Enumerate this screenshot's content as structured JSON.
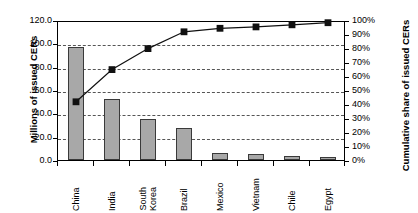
{
  "chart_data": {
    "type": "bar",
    "title": "",
    "subtitle": "",
    "xlabel": "",
    "ylabel": "Millions of issued CERs",
    "y2label": "Cumulative share of issued CERs",
    "categories": [
      "China",
      "India",
      "South\nKorea",
      "Brazil",
      "Mexico",
      "Vietnam",
      "Chile",
      "Egypt"
    ],
    "category_labels_flat": [
      "China",
      "India",
      "South Korea",
      "Brazil",
      "Mexico",
      "Vietnam",
      "Chile",
      "Egypt"
    ],
    "series": [
      {
        "name": "Millions of issued CERs",
        "type": "bar",
        "axis": "left",
        "values": [
          97.0,
          52.5,
          35.0,
          27.5,
          6.0,
          5.0,
          3.5,
          3.0
        ]
      },
      {
        "name": "Cumulative share of issued CERs",
        "type": "line",
        "axis": "right",
        "values": [
          43,
          66,
          81,
          93,
          95.5,
          96.5,
          98,
          99.5
        ]
      }
    ],
    "ylim": [
      0,
      120
    ],
    "y2lim": [
      0,
      100
    ],
    "yticks": [
      "0.0",
      "20.0",
      "40.0",
      "60.0",
      "80.0",
      "100.0",
      "120.0"
    ],
    "ytick_values": [
      0,
      20,
      40,
      60,
      80,
      100,
      120
    ],
    "y2ticks": [
      "0%",
      "10%",
      "20%",
      "30%",
      "40%",
      "50%",
      "60%",
      "70%",
      "80%",
      "90%",
      "100%"
    ],
    "y2tick_values": [
      0,
      10,
      20,
      30,
      40,
      50,
      60,
      70,
      80,
      90,
      100
    ],
    "gridlines": [
      20,
      40,
      60,
      80,
      100
    ],
    "grid": true,
    "legend": "none",
    "colors": {
      "bar_fill": "#a8a8a8",
      "bar_border": "#3a3a3a",
      "line": "#111111",
      "marker": "#111111",
      "grid": "#555555",
      "axis": "#000000",
      "background": "#ffffff"
    }
  }
}
